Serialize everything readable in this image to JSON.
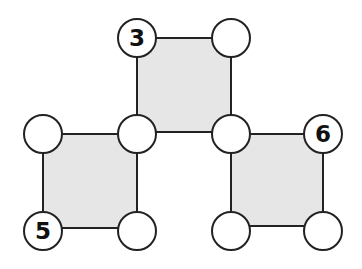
{
  "diagram": {
    "title": "",
    "colors": {
      "square_fill": "#e6e6e6",
      "stroke": "#222222",
      "node_fill": "#ffffff",
      "label": "#111111"
    },
    "node_radius": 19,
    "squares": [
      {
        "id": "top",
        "x": 137,
        "y": 38,
        "size": 94
      },
      {
        "id": "bottom-left",
        "x": 43,
        "y": 134,
        "size": 94
      },
      {
        "id": "bottom-right",
        "x": 231,
        "y": 134,
        "size": 92
      }
    ],
    "nodes": [
      {
        "id": "n1",
        "cx": 137,
        "cy": 38,
        "label": "3"
      },
      {
        "id": "n2",
        "cx": 231,
        "cy": 38,
        "label": ""
      },
      {
        "id": "n3",
        "cx": 43,
        "cy": 134,
        "label": ""
      },
      {
        "id": "n4",
        "cx": 137,
        "cy": 134,
        "label": ""
      },
      {
        "id": "n5",
        "cx": 231,
        "cy": 134,
        "label": ""
      },
      {
        "id": "n6",
        "cx": 323,
        "cy": 134,
        "label": "6"
      },
      {
        "id": "n7",
        "cx": 43,
        "cy": 231,
        "label": "5"
      },
      {
        "id": "n8",
        "cx": 137,
        "cy": 231,
        "label": ""
      },
      {
        "id": "n9",
        "cx": 231,
        "cy": 231,
        "label": ""
      },
      {
        "id": "n10",
        "cx": 323,
        "cy": 231,
        "label": ""
      }
    ]
  }
}
